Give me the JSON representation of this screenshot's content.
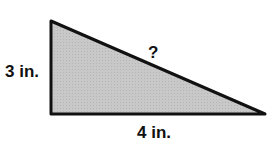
{
  "diagram": {
    "type": "right-triangle",
    "fill_color": "#c4c4c4",
    "stroke_color": "#111111",
    "vertices": {
      "top": [
        51,
        21
      ],
      "right_angle": [
        51,
        114
      ],
      "right": [
        265,
        114
      ]
    },
    "labels": {
      "vertical_leg": "3 in.",
      "horizontal_leg": "4 in.",
      "hypotenuse": "?"
    }
  }
}
